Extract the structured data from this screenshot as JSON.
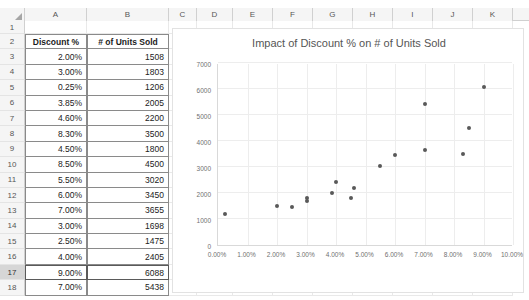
{
  "spreadsheet": {
    "columns": [
      "A",
      "B",
      "C",
      "D",
      "E",
      "F",
      "G",
      "H",
      "I",
      "J",
      "K"
    ],
    "rows": [
      "1",
      "2",
      "3",
      "4",
      "5",
      "6",
      "7",
      "8",
      "9",
      "10",
      "11",
      "12",
      "13",
      "14",
      "15",
      "16",
      "17",
      "18"
    ],
    "selected_row": "17",
    "headers": {
      "discount": "Discount %",
      "units": "# of Units Sold"
    },
    "data_rows": [
      {
        "row": "3",
        "discount": "2.00%",
        "units": "1508"
      },
      {
        "row": "4",
        "discount": "3.00%",
        "units": "1803"
      },
      {
        "row": "5",
        "discount": "0.25%",
        "units": "1206"
      },
      {
        "row": "6",
        "discount": "3.85%",
        "units": "2005"
      },
      {
        "row": "7",
        "discount": "4.60%",
        "units": "2200"
      },
      {
        "row": "8",
        "discount": "8.30%",
        "units": "3500"
      },
      {
        "row": "9",
        "discount": "4.50%",
        "units": "1800"
      },
      {
        "row": "10",
        "discount": "8.50%",
        "units": "4500"
      },
      {
        "row": "11",
        "discount": "5.50%",
        "units": "3020"
      },
      {
        "row": "12",
        "discount": "6.00%",
        "units": "3450"
      },
      {
        "row": "13",
        "discount": "7.00%",
        "units": "3655"
      },
      {
        "row": "14",
        "discount": "3.00%",
        "units": "1698"
      },
      {
        "row": "15",
        "discount": "2.50%",
        "units": "1475"
      },
      {
        "row": "16",
        "discount": "4.00%",
        "units": "2405"
      },
      {
        "row": "17",
        "discount": "9.00%",
        "units": "6088"
      },
      {
        "row": "18",
        "discount": "7.00%",
        "units": "5438"
      }
    ]
  },
  "chart_data": {
    "type": "scatter",
    "title": "Impact of Discount % on # of Units Sold",
    "xlabel": "",
    "ylabel": "",
    "xlim": [
      0,
      10
    ],
    "ylim": [
      0,
      7000
    ],
    "grid": true,
    "legend": false,
    "marker_color": "#595959",
    "xticklabels": [
      "0.00%",
      "1.00%",
      "2.00%",
      "3.00%",
      "4.00%",
      "5.00%",
      "6.00%",
      "7.00%",
      "8.00%",
      "9.00%",
      "10.00%"
    ],
    "xticks": [
      0,
      1,
      2,
      3,
      4,
      5,
      6,
      7,
      8,
      9,
      10
    ],
    "yticklabels": [
      "0",
      "1000",
      "2000",
      "3000",
      "4000",
      "5000",
      "6000",
      "7000"
    ],
    "yticks": [
      0,
      1000,
      2000,
      3000,
      4000,
      5000,
      6000,
      7000
    ],
    "series": [
      {
        "name": "# of Units Sold",
        "points": [
          {
            "x": 2.0,
            "y": 1508
          },
          {
            "x": 3.0,
            "y": 1803
          },
          {
            "x": 0.25,
            "y": 1206
          },
          {
            "x": 3.85,
            "y": 2005
          },
          {
            "x": 4.6,
            "y": 2200
          },
          {
            "x": 8.3,
            "y": 3500
          },
          {
            "x": 4.5,
            "y": 1800
          },
          {
            "x": 8.5,
            "y": 4500
          },
          {
            "x": 5.5,
            "y": 3020
          },
          {
            "x": 6.0,
            "y": 3450
          },
          {
            "x": 7.0,
            "y": 3655
          },
          {
            "x": 3.0,
            "y": 1698
          },
          {
            "x": 2.5,
            "y": 1475
          },
          {
            "x": 4.0,
            "y": 2405
          },
          {
            "x": 9.0,
            "y": 6088
          },
          {
            "x": 7.0,
            "y": 5438
          }
        ]
      }
    ]
  }
}
